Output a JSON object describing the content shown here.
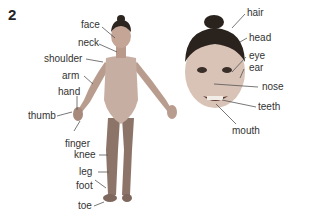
{
  "figure": {
    "number": "2",
    "full_body_labels": [
      "face",
      "neck",
      "shoulder",
      "arm",
      "hand",
      "thumb",
      "finger",
      "knee",
      "leg",
      "foot",
      "toe"
    ],
    "face_labels": [
      "hair",
      "head",
      "eye",
      "ear",
      "nose",
      "teeth",
      "mouth"
    ]
  },
  "labels": {
    "face": "face",
    "neck": "neck",
    "shoulder": "shoulder",
    "arm": "arm",
    "hand": "hand",
    "thumb": "thumb",
    "finger": "finger",
    "knee": "knee",
    "leg": "leg",
    "foot": "foot",
    "toe": "toe",
    "hair": "hair",
    "head": "head",
    "eye": "eye",
    "ear": "ear",
    "nose": "nose",
    "teeth": "teeth",
    "mouth": "mouth"
  }
}
